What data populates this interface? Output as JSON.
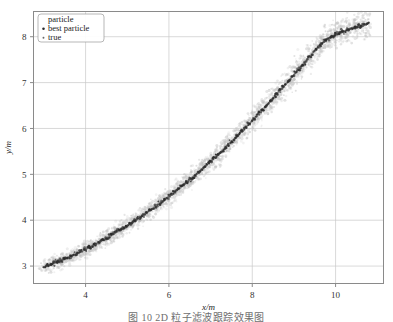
{
  "figure": {
    "caption": "图 10  2D 粒子滤波跟踪效果图",
    "background_color": "#ffffff"
  },
  "chart_data": {
    "type": "scatter",
    "title": "",
    "xlabel": "x/m",
    "ylabel": "y/m",
    "xlim": [
      2.75,
      11.15
    ],
    "ylim": [
      2.62,
      8.55
    ],
    "xticks": [
      4,
      6,
      8,
      10
    ],
    "yticks": [
      3,
      4,
      5,
      6,
      7,
      8
    ],
    "xtick_labels": [
      "4",
      "6",
      "8",
      "10"
    ],
    "ytick_labels": [
      "3",
      "4",
      "5",
      "6",
      "7",
      "8"
    ],
    "grid": true,
    "grid_color": "#c9c9c9",
    "frame_color": "#8a8a8a",
    "legend_position": "upper left",
    "legend": [
      {
        "label": "particle",
        "marker": "dot",
        "color": "#b8b8b8",
        "size": 1.0
      },
      {
        "label": "best particle",
        "marker": "dot",
        "color": "#2b2b2b",
        "size": 1.6
      },
      {
        "label": "true",
        "marker": "dot",
        "color": "#6a6a6a",
        "size": 1.2
      }
    ],
    "series": [
      {
        "name": "particle",
        "color": "#bdbdbd",
        "marker": "dot",
        "description": "diffuse cloud of particles scattered around the true trajectory",
        "spread": 0.22,
        "count": 2600
      },
      {
        "name": "best particle",
        "color": "#2b2b2b",
        "marker": "dot",
        "description": "estimated track, dense dark dots following the true curve",
        "spread": 0.055,
        "count": 430
      },
      {
        "name": "true",
        "color": "#707070",
        "marker": "dot",
        "description": "ground-truth monotonically increasing curve",
        "spread": 0.0,
        "count": 430
      }
    ],
    "true_curve": {
      "x": [
        3.0,
        3.2,
        3.4,
        3.6,
        3.8,
        4.0,
        4.2,
        4.4,
        4.6,
        4.8,
        5.0,
        5.2,
        5.4,
        5.6,
        5.8,
        6.0,
        6.2,
        6.4,
        6.6,
        6.8,
        7.0,
        7.2,
        7.4,
        7.6,
        7.8,
        8.0,
        8.2,
        8.4,
        8.6,
        8.8,
        9.0,
        9.2,
        9.4,
        9.6,
        9.8,
        10.0,
        10.2,
        10.4,
        10.6,
        10.8
      ],
      "y": [
        2.98,
        3.05,
        3.12,
        3.2,
        3.28,
        3.37,
        3.46,
        3.56,
        3.66,
        3.77,
        3.88,
        4.0,
        4.12,
        4.25,
        4.38,
        4.52,
        4.66,
        4.81,
        4.96,
        5.12,
        5.28,
        5.45,
        5.62,
        5.8,
        5.98,
        6.17,
        6.36,
        6.56,
        6.76,
        6.96,
        7.17,
        7.38,
        7.59,
        7.8,
        7.95,
        8.05,
        8.12,
        8.18,
        8.24,
        8.3
      ]
    }
  }
}
